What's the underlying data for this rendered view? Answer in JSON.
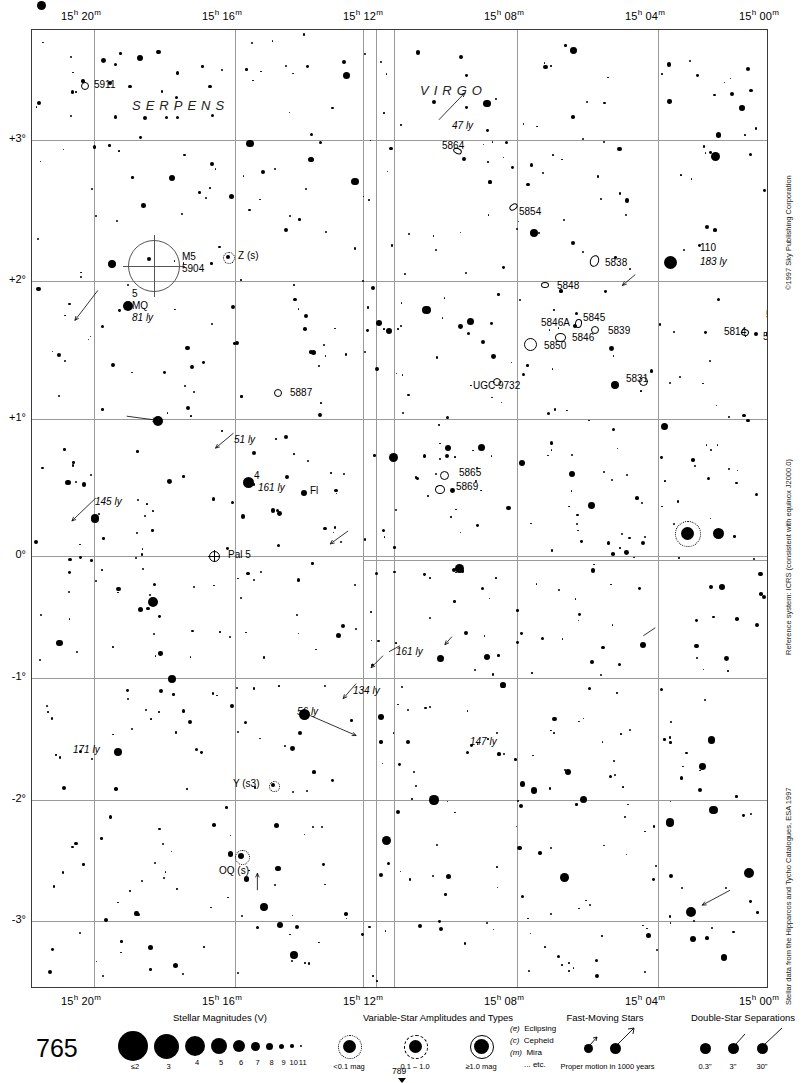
{
  "page": {
    "number": "765",
    "next_page": "789",
    "header_mark": "logo-dot"
  },
  "axes": {
    "ra_ticks": [
      {
        "label": "15h 20m",
        "h": "15",
        "m": "20",
        "x": 62
      },
      {
        "label": "15h 16m",
        "h": "15",
        "m": "16",
        "x": 203
      },
      {
        "label": "15h 12m",
        "h": "15",
        "m": "12",
        "x": 344
      },
      {
        "label": "15h 08m",
        "h": "15",
        "m": "08",
        "x": 485
      },
      {
        "label": "15h 04m",
        "h": "15",
        "m": "04",
        "x": 626
      },
      {
        "label": "15h 00m",
        "h": "15",
        "m": "00",
        "x": 740
      }
    ],
    "dec_ticks": [
      {
        "label": "+3°",
        "y": 110
      },
      {
        "label": "+2°",
        "y": 251
      },
      {
        "label": "+1°",
        "y": 389
      },
      {
        "label": "0°",
        "y": 526
      },
      {
        "label": "-1°",
        "y": 648
      },
      {
        "label": "-2°",
        "y": 770
      },
      {
        "label": "-3°",
        "y": 891
      }
    ]
  },
  "constellations": [
    {
      "name": "SERPENS",
      "x": 100,
      "y": 68
    },
    {
      "name": "VIRGO",
      "x": 388,
      "y": 53
    },
    {
      "name": "SERPENS",
      "x": 152,
      "y": 965
    },
    {
      "name": "LIBRA",
      "x": 392,
      "y": 965
    }
  ],
  "objects": {
    "deep_sky": [
      {
        "id": "5911",
        "x": 62,
        "y": 55
      },
      {
        "id": "5864",
        "x": 410,
        "y": 116
      },
      {
        "id": "5854",
        "x": 487,
        "y": 182
      },
      {
        "id": "5838",
        "x": 573,
        "y": 233
      },
      {
        "id": "5848",
        "x": 525,
        "y": 256
      },
      {
        "id": "5846A",
        "x": 509,
        "y": 293
      },
      {
        "id": "5845",
        "x": 551,
        "y": 288
      },
      {
        "id": "5846",
        "x": 540,
        "y": 308
      },
      {
        "id": "5839",
        "x": 576,
        "y": 301
      },
      {
        "id": "5850",
        "x": 512,
        "y": 316
      },
      {
        "id": "5831",
        "x": 594,
        "y": 349
      },
      {
        "id": "5806",
        "x": 740,
        "y": 258
      },
      {
        "id": "5813",
        "x": 734,
        "y": 285
      },
      {
        "id": "5814",
        "x": 692,
        "y": 302
      },
      {
        "id": "5811",
        "x": 731,
        "y": 307
      },
      {
        "id": "UGC 9732",
        "x": 441,
        "y": 356
      },
      {
        "id": "5865",
        "x": 427,
        "y": 443
      },
      {
        "id": "5869",
        "x": 424,
        "y": 457
      },
      {
        "id": "5887",
        "x": 258,
        "y": 363
      },
      {
        "id": "M5",
        "x": 150,
        "y": 227
      },
      {
        "id": "5904",
        "x": 150,
        "y": 239
      },
      {
        "id": "Pal 5",
        "x": 196,
        "y": 525
      }
    ],
    "named_stars": [
      {
        "id": "110",
        "dist": "183 ly",
        "x": 655,
        "y": 224
      },
      {
        "id": "5",
        "dist": "81 ly",
        "flam": "MQ",
        "x": 95,
        "y": 275
      },
      {
        "id": "4",
        "dist": "161 ly",
        "x": 216,
        "y": 452
      },
      {
        "id": "Fl",
        "x": 272,
        "y": 463
      }
    ],
    "variables": [
      {
        "id": "Z (s)",
        "x": 214,
        "y": 227
      },
      {
        "id": "Y (s3)",
        "x": 245,
        "y": 754
      },
      {
        "id": "OQ (s)",
        "x": 238,
        "y": 828
      }
    ],
    "proper_motion": [
      {
        "dist": "47 ly",
        "x": 436,
        "y": 98
      },
      {
        "dist": "145 ly",
        "x": 66,
        "y": 474
      },
      {
        "dist": "51 ly",
        "x": 216,
        "y": 410
      },
      {
        "dist": "161 ly",
        "x": 374,
        "y": 625
      },
      {
        "dist": "134 ly",
        "x": 332,
        "y": 665
      },
      {
        "dist": "56 ly",
        "x": 272,
        "y": 684
      },
      {
        "dist": "171 ly",
        "x": 82,
        "y": 722
      },
      {
        "dist": "147 ly",
        "x": 446,
        "y": 715
      }
    ]
  },
  "legend": {
    "magnitudes": {
      "title": "Stellar Magnitudes (V)",
      "entries": [
        {
          "label": "≤2",
          "d": 30
        },
        {
          "label": "3",
          "d": 25
        },
        {
          "label": "4",
          "d": 20
        },
        {
          "label": "5",
          "d": 16
        },
        {
          "label": "6",
          "d": 12
        },
        {
          "label": "7",
          "d": 9
        },
        {
          "label": "8",
          "d": 7
        },
        {
          "label": "9",
          "d": 5
        },
        {
          "label": "10",
          "d": 3.5
        },
        {
          "label": "11",
          "d": 2.4
        }
      ]
    },
    "variables": {
      "title": "Variable-Star Amplitudes and Types",
      "entries": [
        {
          "label": "<0.1 mag",
          "ring": "dotted"
        },
        {
          "label": "0.1 – 1.0",
          "ring": "dashed"
        },
        {
          "label": "≥1.0 mag",
          "ring": "solid"
        }
      ],
      "types": [
        {
          "code": "(e)",
          "name": "Eclipsing"
        },
        {
          "code": "(c)",
          "name": "Cepheid"
        },
        {
          "code": "(m)",
          "name": "Mira"
        },
        {
          "code": "",
          "name": "... etc."
        }
      ]
    },
    "fast_moving": {
      "title": "Fast-Moving Stars",
      "caption": "Proper motion in 1000 years"
    },
    "double_stars": {
      "title": "Double-Star Separations",
      "entries": [
        "0.3\"",
        "3\"",
        "30\""
      ]
    }
  },
  "credits": [
    {
      "text": "©1997 Sky Publishing Corporation",
      "y": 40
    },
    {
      "text": "Reference system: ICRS (consistent with equinox J2000.0)",
      "y": 405
    },
    {
      "text": "Stellar data from the Hipparcos and Tycho Catalogues, ESA 1997",
      "y": 755
    }
  ],
  "colors": {
    "ink": "#000000",
    "grid": "#9a9a9a",
    "frame": "#3a3a3a",
    "paper": "#ffffff"
  }
}
